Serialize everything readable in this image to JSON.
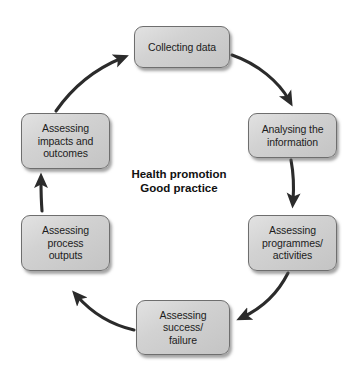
{
  "diagram": {
    "title_center": "Health promotion\nGood practice",
    "accent_color": "#2b2b2b",
    "node_fill_color": "#d2d2d2",
    "node_border_color": "#6e6e6e",
    "nodes": [
      {
        "id": "collecting-data",
        "label": "Collecting data",
        "x": 134,
        "y": 26,
        "w": 96,
        "h": 42
      },
      {
        "id": "analysing-the-information",
        "label": "Analysing the\ninformation",
        "x": 248,
        "y": 113,
        "w": 89,
        "h": 45
      },
      {
        "id": "assessing-programmes-activities",
        "label": "Assessing\nprogrammes/\nactivities",
        "x": 248,
        "y": 215,
        "w": 89,
        "h": 56
      },
      {
        "id": "assessing-success-failure",
        "label": "Assessing\nsuccess/\nfailure",
        "x": 136,
        "y": 300,
        "w": 94,
        "h": 55
      },
      {
        "id": "assessing-process-outputs",
        "label": "Assessing\nprocess\noutputs",
        "x": 21,
        "y": 215,
        "w": 89,
        "h": 56
      },
      {
        "id": "assessing-impacts-outcomes",
        "label": "Assessing\nimpacts and\noutcomes",
        "x": 21,
        "y": 113,
        "w": 89,
        "h": 56
      }
    ],
    "connections": [
      {
        "id": "collecting-data-to-analysing",
        "from": "collecting-data",
        "to": "analysing-the-information",
        "style": "curved"
      },
      {
        "id": "analysing-to-programmes",
        "from": "analysing-the-information",
        "to": "assessing-programmes-activities",
        "style": "straight"
      },
      {
        "id": "programmes-to-success-failure",
        "from": "assessing-programmes-activities",
        "to": "assessing-success-failure",
        "style": "curved"
      },
      {
        "id": "success-failure-to-process-outputs",
        "from": "assessing-success-failure",
        "to": "assessing-process-outputs",
        "style": "curved"
      },
      {
        "id": "process-outputs-to-impacts",
        "from": "assessing-process-outputs",
        "to": "assessing-impacts-outcomes",
        "style": "straight"
      },
      {
        "id": "impacts-to-collecting-data",
        "from": "assessing-impacts-outcomes",
        "to": "collecting-data",
        "style": "curved"
      }
    ]
  }
}
